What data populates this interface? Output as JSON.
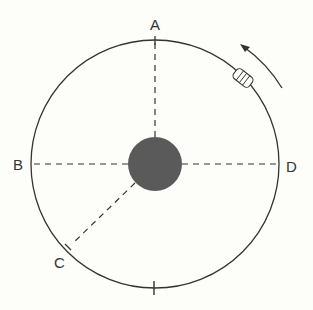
{
  "diagram": {
    "labels": {
      "A": "A",
      "B": "B",
      "C": "C",
      "D": "D"
    },
    "colors": {
      "background": "#fdfdf9",
      "line": "#333333",
      "planet": "#5a5a5a"
    },
    "elements": {
      "planet": "dark filled circle at center",
      "orbit": "circular orbit path",
      "satellite": "small satellite on orbit between A and D",
      "direction_arrow": "curved arrow indicating counterclockwise motion",
      "radial_lines": [
        "center to A (top)",
        "center to B (left)",
        "center to D (right)",
        "center to C (lower-left)"
      ],
      "bottom_tick": "unlabeled tick mark at bottom of orbit"
    }
  }
}
